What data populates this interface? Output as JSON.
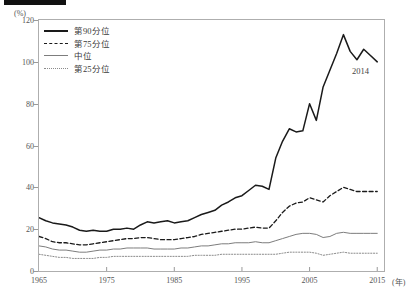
{
  "header": {
    "tag": "",
    "title": ""
  },
  "axis": {
    "y_unit": "(%)",
    "x_unit": "(年)",
    "y_ticks": [
      "0",
      "20",
      "40",
      "60",
      "80",
      "100",
      "120"
    ],
    "x_ticks": [
      "1965",
      "1975",
      "1985",
      "1995",
      "2005",
      "2015"
    ]
  },
  "legend": {
    "items": [
      {
        "label": "第90分位",
        "style": "solid-thick",
        "color": "#1a1a1a"
      },
      {
        "label": "第75分位",
        "style": "dashed",
        "color": "#1a1a1a"
      },
      {
        "label": "中位",
        "style": "solid-thin",
        "color": "#7d7d7d"
      },
      {
        "label": "第25分位",
        "style": "dotted",
        "color": "#8b8b8b"
      }
    ]
  },
  "annotations": [
    {
      "text": "2014",
      "x": 2013.2,
      "y": 93
    }
  ],
  "chart_data": {
    "type": "line",
    "title": "",
    "xlabel": "(年)",
    "ylabel": "(%)",
    "xlim": [
      1965,
      2016
    ],
    "ylim": [
      0,
      120
    ],
    "grid": false,
    "legend_position": "top-left",
    "x": [
      1965,
      1966,
      1967,
      1968,
      1969,
      1970,
      1971,
      1972,
      1973,
      1974,
      1975,
      1976,
      1977,
      1978,
      1979,
      1980,
      1981,
      1982,
      1983,
      1984,
      1985,
      1986,
      1987,
      1988,
      1989,
      1990,
      1991,
      1992,
      1993,
      1994,
      1995,
      1996,
      1997,
      1998,
      1999,
      2000,
      2001,
      2002,
      2003,
      2004,
      2005,
      2006,
      2007,
      2008,
      2009,
      2010,
      2011,
      2012,
      2013,
      2014,
      2015
    ],
    "series": [
      {
        "name": "第90分位",
        "style": "solid-thick",
        "color": "#1a1a1a",
        "values": [
          25.5,
          24.0,
          23.0,
          22.5,
          22.0,
          21.0,
          19.5,
          19.0,
          19.5,
          19.0,
          19.0,
          20.0,
          20.0,
          20.5,
          20.0,
          22.0,
          23.5,
          23.0,
          23.5,
          24.0,
          23.0,
          23.5,
          24.0,
          25.5,
          27.0,
          28.0,
          29.0,
          31.5,
          33.0,
          35.0,
          36.0,
          38.5,
          41.0,
          40.5,
          39.0,
          54.0,
          62.0,
          68.0,
          66.5,
          67.0,
          80.0,
          72.0,
          88.0,
          96.0,
          104.0,
          113.0,
          105.0,
          101.0,
          106.0,
          103.0,
          100.0
        ]
      },
      {
        "name": "第75分位",
        "style": "dashed",
        "color": "#1a1a1a",
        "values": [
          16.5,
          15.5,
          14.0,
          13.5,
          13.5,
          13.0,
          12.5,
          12.5,
          13.0,
          13.5,
          14.0,
          14.5,
          15.0,
          15.5,
          15.5,
          16.0,
          16.0,
          15.5,
          15.0,
          15.0,
          15.0,
          15.5,
          16.0,
          16.5,
          17.5,
          18.0,
          18.5,
          19.0,
          19.5,
          20.0,
          20.0,
          20.5,
          21.0,
          20.5,
          20.5,
          24.0,
          28.0,
          31.0,
          32.5,
          33.0,
          35.0,
          34.0,
          33.0,
          36.0,
          38.0,
          40.0,
          39.0,
          38.0,
          38.0,
          38.0,
          38.0
        ]
      },
      {
        "name": "中位",
        "style": "solid-thin",
        "color": "#7d7d7d",
        "values": [
          12.0,
          11.5,
          10.5,
          10.0,
          10.0,
          9.5,
          9.0,
          9.0,
          9.5,
          10.0,
          10.0,
          10.5,
          10.5,
          11.0,
          11.0,
          11.0,
          11.0,
          10.5,
          10.5,
          10.5,
          10.5,
          11.0,
          11.0,
          11.5,
          12.0,
          12.0,
          12.5,
          13.0,
          13.0,
          13.5,
          13.5,
          13.5,
          14.0,
          13.5,
          13.5,
          14.5,
          15.5,
          16.5,
          17.5,
          18.0,
          18.0,
          17.5,
          16.0,
          16.5,
          18.0,
          18.5,
          18.0,
          18.0,
          18.0,
          18.0,
          18.0
        ]
      },
      {
        "name": "第25分位",
        "style": "dotted",
        "color": "#8b8b8b",
        "values": [
          8.0,
          7.5,
          7.0,
          6.5,
          6.5,
          6.0,
          6.0,
          6.0,
          6.0,
          6.5,
          6.5,
          7.0,
          7.0,
          7.0,
          7.0,
          7.0,
          7.0,
          7.0,
          7.0,
          7.0,
          7.0,
          7.0,
          7.0,
          7.5,
          7.5,
          7.5,
          7.5,
          8.0,
          8.0,
          8.0,
          8.0,
          8.0,
          8.0,
          8.0,
          8.0,
          8.0,
          8.5,
          9.0,
          9.0,
          9.0,
          9.0,
          8.5,
          7.5,
          8.0,
          8.5,
          9.0,
          8.5,
          8.5,
          8.5,
          8.5,
          8.5
        ]
      }
    ]
  }
}
